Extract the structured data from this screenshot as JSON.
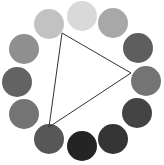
{
  "diagram": {
    "type": "color-wheel-triad",
    "circle_radius": 15,
    "circles": [
      {
        "position": "top",
        "cx": 82,
        "cy": 16,
        "color": "#d9d9d9"
      },
      {
        "position": "top-right",
        "cx": 113,
        "cy": 23,
        "color": "#a8a8a8"
      },
      {
        "position": "right-upper",
        "cx": 138,
        "cy": 48,
        "color": "#5e5e5e"
      },
      {
        "position": "right",
        "cx": 146,
        "cy": 81,
        "color": "#747474"
      },
      {
        "position": "right-lower",
        "cx": 137,
        "cy": 113,
        "color": "#444444"
      },
      {
        "position": "bottom-right",
        "cx": 113,
        "cy": 139,
        "color": "#353535"
      },
      {
        "position": "bottom",
        "cx": 82,
        "cy": 146,
        "color": "#242424"
      },
      {
        "position": "bottom-left",
        "cx": 49,
        "cy": 139,
        "color": "#575757"
      },
      {
        "position": "left-lower",
        "cx": 24,
        "cy": 114,
        "color": "#747474"
      },
      {
        "position": "left",
        "cx": 17,
        "cy": 82,
        "color": "#636363"
      },
      {
        "position": "left-upper",
        "cx": 24,
        "cy": 49,
        "color": "#8f8f8f"
      },
      {
        "position": "top-left",
        "cx": 49,
        "cy": 24,
        "color": "#c2c2c2"
      }
    ],
    "triangle": {
      "points": [
        [
          62,
          33
        ],
        [
          131,
          73
        ],
        [
          49,
          127
        ]
      ],
      "stroke": "#333333",
      "stroke_width": 1
    }
  }
}
